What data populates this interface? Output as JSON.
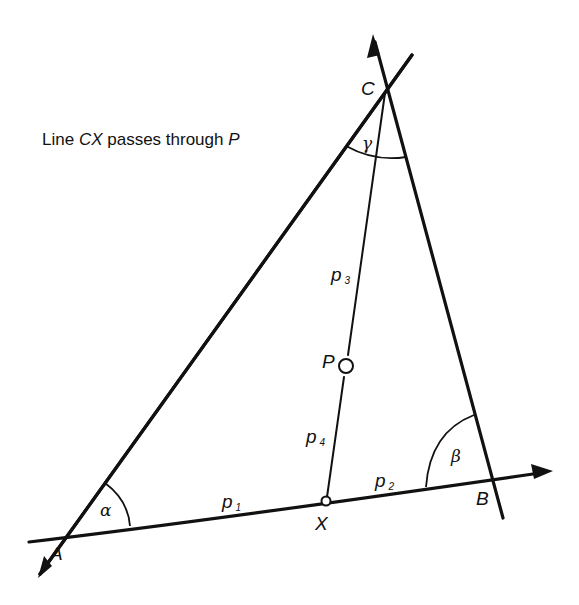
{
  "figure": {
    "caption_parts": {
      "prefix": "Line ",
      "line_name": "CX",
      "middle": " passes through ",
      "point_name": "P"
    },
    "points": {
      "A": "A",
      "B": "B",
      "C": "C",
      "X": "X",
      "P": "P"
    },
    "angles": {
      "alpha": "α",
      "beta": "β",
      "gamma": "γ"
    },
    "segments": {
      "p1": {
        "base": "p",
        "sub": "1"
      },
      "p2": {
        "base": "p",
        "sub": "2"
      },
      "p3": {
        "base": "p",
        "sub": "3"
      },
      "p4": {
        "base": "p",
        "sub": "4"
      }
    },
    "colors": {
      "ink": "#111111",
      "background": "#ffffff"
    }
  }
}
